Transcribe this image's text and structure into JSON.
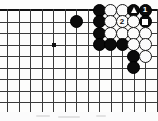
{
  "diagram": {
    "kind": "go-board-diagram",
    "title": "",
    "board": {
      "origin_x": 7,
      "origin_y": 10,
      "spacing": 11.5,
      "cols_visible": 13,
      "rows_visible": 9,
      "top_edge_is_board_edge": true,
      "left_edge_is_board_edge": false,
      "right_edge_is_board_edge": false,
      "bottom_edge_is_board_edge": false,
      "line_color": "#3a3a3a",
      "edge_color": "#111111",
      "background_color": "#fdfdfc"
    },
    "star_points": [
      {
        "col": 4,
        "row": 3
      }
    ],
    "stones": [
      {
        "col": 8,
        "row": 0,
        "color": "black",
        "label": "",
        "mark": ""
      },
      {
        "col": 9,
        "row": 0,
        "color": "white",
        "label": "",
        "mark": ""
      },
      {
        "col": 10,
        "row": 0,
        "color": "white",
        "label": "",
        "mark": ""
      },
      {
        "col": 11,
        "row": 0,
        "color": "black",
        "label": "",
        "mark": "triangle"
      },
      {
        "col": 12,
        "row": 0,
        "color": "black",
        "label": "1",
        "mark": ""
      },
      {
        "col": 6,
        "row": 1,
        "color": "black",
        "label": "",
        "mark": ""
      },
      {
        "col": 8,
        "row": 1,
        "color": "black",
        "label": "",
        "mark": ""
      },
      {
        "col": 9,
        "row": 1,
        "color": "white",
        "label": "",
        "mark": ""
      },
      {
        "col": 10,
        "row": 1,
        "color": "white",
        "label": "2",
        "mark": ""
      },
      {
        "col": 11,
        "row": 1,
        "color": "white",
        "label": "",
        "mark": ""
      },
      {
        "col": 12,
        "row": 1,
        "color": "black",
        "label": "",
        "mark": "square"
      },
      {
        "col": 8,
        "row": 2,
        "color": "black",
        "label": "",
        "mark": ""
      },
      {
        "col": 9,
        "row": 2,
        "color": "white",
        "label": "",
        "mark": ""
      },
      {
        "col": 10,
        "row": 2,
        "color": "white",
        "label": "",
        "mark": ""
      },
      {
        "col": 11,
        "row": 2,
        "color": "white",
        "label": "",
        "mark": ""
      },
      {
        "col": 12,
        "row": 2,
        "color": "white",
        "label": "",
        "mark": ""
      },
      {
        "col": 8,
        "row": 3,
        "color": "black",
        "label": "",
        "mark": ""
      },
      {
        "col": 9,
        "row": 3,
        "color": "black",
        "label": "",
        "mark": ""
      },
      {
        "col": 10,
        "row": 3,
        "color": "black",
        "label": "",
        "mark": ""
      },
      {
        "col": 11,
        "row": 3,
        "color": "white",
        "label": "",
        "mark": ""
      },
      {
        "col": 12,
        "row": 3,
        "color": "white",
        "label": "",
        "mark": ""
      },
      {
        "col": 11,
        "row": 4,
        "color": "black",
        "label": "",
        "mark": ""
      },
      {
        "col": 12,
        "row": 4,
        "color": "white",
        "label": "",
        "mark": ""
      },
      {
        "col": 11,
        "row": 5,
        "color": "black",
        "label": "",
        "mark": ""
      }
    ],
    "move_labels": [
      {
        "number": "1",
        "color": "black"
      },
      {
        "number": "2",
        "color": "white"
      }
    ],
    "markers": [
      {
        "shape": "triangle",
        "on_color": "black"
      },
      {
        "shape": "square",
        "on_color": "black"
      }
    ],
    "scan_artifact": {
      "present": true,
      "color": "#e2e2e2",
      "segments": [
        {
          "x": 36,
          "y": 3,
          "w": 14
        },
        {
          "x": 58,
          "y": 4,
          "w": 22
        },
        {
          "x": 96,
          "y": 3,
          "w": 10
        }
      ]
    }
  }
}
